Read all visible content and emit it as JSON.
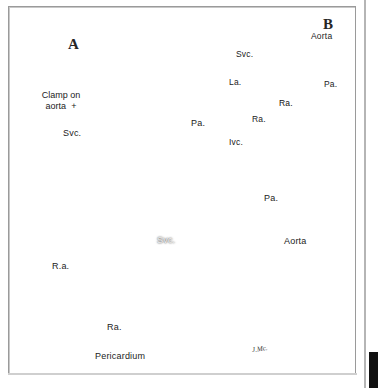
{
  "figure": {
    "medium": "halftone pen-and-ink surgical illustration (scanned book plate)",
    "panels": [
      {
        "id": "A",
        "letter": "A",
        "description": "Operative exposure of the heart; aorta clamped, superior vena cava cannulated, right atrium opened showing interior, pericardium retracted."
      },
      {
        "id": "B",
        "letter": "B",
        "description": "Completed repair viewed from the front; suture lines visible over the atrium, caval and aortic connections labelled."
      }
    ],
    "signature": "J.Mc."
  },
  "panel_a": {
    "letter": "A",
    "labels": [
      {
        "id": "clamp_on_aorta",
        "text_line1": "Clamp on",
        "text_line2": "aorta",
        "marker": "+",
        "x": 30,
        "y": 92
      },
      {
        "id": "svc_upper",
        "text": "Svc.",
        "x": 64,
        "y": 133
      },
      {
        "id": "pa_upper",
        "text": "Pa.",
        "x": 192,
        "y": 123
      },
      {
        "id": "pa_right",
        "text": "Pa.",
        "x": 264,
        "y": 198
      },
      {
        "id": "aorta_right",
        "text": "Aorta",
        "x": 284,
        "y": 241
      },
      {
        "id": "svc_center",
        "text": "Svc.",
        "x": 158,
        "y": 240
      },
      {
        "id": "ra_left",
        "text": "R.a.",
        "x": 53,
        "y": 266
      },
      {
        "id": "ra_lower",
        "text": "Ra.",
        "x": 108,
        "y": 327
      },
      {
        "id": "pericardium",
        "text": "Pericardium",
        "x": 96,
        "y": 357
      }
    ]
  },
  "panel_b": {
    "letter": "B",
    "labels": [
      {
        "id": "aorta",
        "text": "Aorta",
        "x": 311,
        "y": 36
      },
      {
        "id": "svc",
        "text": "Svc.",
        "x": 237,
        "y": 54
      },
      {
        "id": "la",
        "text": "La.",
        "x": 230,
        "y": 81
      },
      {
        "id": "pa",
        "text": "Pa.",
        "x": 324,
        "y": 84
      },
      {
        "id": "ra_center",
        "text": "Ra.",
        "x": 280,
        "y": 103
      },
      {
        "id": "ra_left",
        "text": "Ra.",
        "x": 257,
        "y": 118
      },
      {
        "id": "ivc",
        "text": "Ivc.",
        "x": 230,
        "y": 141
      }
    ]
  },
  "colors": {
    "page_background": "#ffffff",
    "frame_line": "#9a9a9a",
    "ink": "#1b1b1b",
    "tissue_mid": "#8d8d8d",
    "tissue_dark": "#2a2a2a",
    "tissue_light": "#d8d8d8",
    "dark_band": "#111111"
  }
}
